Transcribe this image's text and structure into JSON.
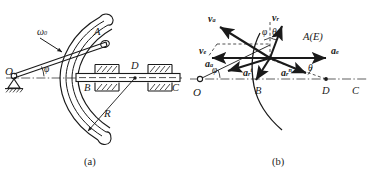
{
  "figure": {
    "caption_a": "(a)",
    "caption_b": "(b)"
  },
  "panel_a": {
    "name": "mechanism-schematic",
    "labels": {
      "origin": "O",
      "pin": "A",
      "omega": "ω",
      "omega_sub": "0",
      "phi": "φ",
      "slider_left": "B",
      "point_d": "D",
      "bar_right": "C",
      "radius": "R"
    }
  },
  "panel_b": {
    "name": "velocity-acceleration-diagram",
    "labels": {
      "origin": "O",
      "point_label": "A(E)",
      "point_b": "B",
      "point_d": "D",
      "point_c": "C",
      "phi_left": "φ",
      "phi_top": "φ",
      "theta_top": "θ",
      "theta_right": "θ",
      "v_abs": "v",
      "v_abs_sub": "a",
      "v_rel": "v",
      "v_rel_sub": "r",
      "v_ent": "v",
      "v_ent_sub": "e",
      "a_abs": "a",
      "a_abs_sub": "a",
      "a_ent": "a",
      "a_ent_sub": "e",
      "a_rel_t": "a",
      "a_rel_t_sub": "r",
      "a_rel_t_sup": "t",
      "a_rel_n": "a",
      "a_rel_n_sub": "r",
      "a_rel_n_sup": "n"
    }
  },
  "style": {
    "ink": "#1a1a1a",
    "background": "#ffffff"
  }
}
